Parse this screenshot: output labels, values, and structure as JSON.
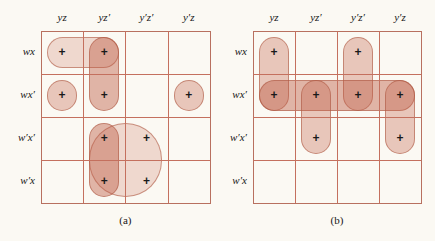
{
  "figure": {
    "background_color": "#fbf9f3",
    "grid_line_color": "#c4705e",
    "highlight_color": "#c4644c",
    "mark_symbol": "+"
  },
  "maps": [
    {
      "id": "a",
      "caption": "(a)",
      "column_headers": [
        "yz",
        "yz′",
        "y′z′",
        "y′z"
      ],
      "row_labels": [
        "wx",
        "wx′",
        "w′x′",
        "w′x"
      ],
      "cells": [
        [
          "+",
          "+",
          "",
          ""
        ],
        [
          "+",
          "+",
          "",
          "+"
        ],
        [
          "",
          "+",
          "+",
          ""
        ],
        [
          "",
          "+",
          "+",
          ""
        ]
      ],
      "groups": [
        {
          "name": "group-wx-yz-yzp",
          "cols": [
            0,
            1
          ],
          "rows": [
            0,
            0
          ],
          "shade": "light"
        },
        {
          "name": "group-yzp-wx-wxp",
          "cols": [
            1,
            1
          ],
          "rows": [
            0,
            1
          ],
          "shade": "dark"
        },
        {
          "name": "group-wxp-yz",
          "cols": [
            0,
            0
          ],
          "rows": [
            1,
            1
          ],
          "shade": "normal"
        },
        {
          "name": "group-wxp-ypz",
          "cols": [
            3,
            3
          ],
          "rows": [
            1,
            1
          ],
          "shade": "normal"
        },
        {
          "name": "group-wpxp-wpx-yzp-ypzp",
          "cols": [
            1,
            2
          ],
          "rows": [
            2,
            3
          ],
          "shade": "light"
        },
        {
          "name": "group-yzp-wpxp-wpx",
          "cols": [
            1,
            1
          ],
          "rows": [
            2,
            3
          ],
          "shade": "dark"
        }
      ]
    },
    {
      "id": "b",
      "caption": "(b)",
      "column_headers": [
        "yz",
        "yz′",
        "y′z′",
        "y′z"
      ],
      "row_labels": [
        "wx",
        "wx′",
        "w′x′",
        "w′x"
      ],
      "cells": [
        [
          "+",
          "",
          "+",
          ""
        ],
        [
          "+",
          "+",
          "+",
          "+"
        ],
        [
          "",
          "+",
          "",
          "+"
        ],
        [
          "",
          "",
          "",
          ""
        ]
      ],
      "groups": [
        {
          "name": "group-yz-wx-wxp",
          "cols": [
            0,
            0
          ],
          "rows": [
            0,
            1
          ],
          "shade": "normal"
        },
        {
          "name": "group-ypzp-wx-wxp",
          "cols": [
            2,
            2
          ],
          "rows": [
            0,
            1
          ],
          "shade": "normal"
        },
        {
          "name": "group-wxp-row",
          "cols": [
            0,
            3
          ],
          "rows": [
            1,
            1
          ],
          "shade": "dark"
        },
        {
          "name": "group-yzp-wxp-wpxp",
          "cols": [
            1,
            1
          ],
          "rows": [
            1,
            2
          ],
          "shade": "normal"
        },
        {
          "name": "group-ypz-wxp-wpxp",
          "cols": [
            3,
            3
          ],
          "rows": [
            1,
            2
          ],
          "shade": "normal"
        }
      ]
    }
  ]
}
